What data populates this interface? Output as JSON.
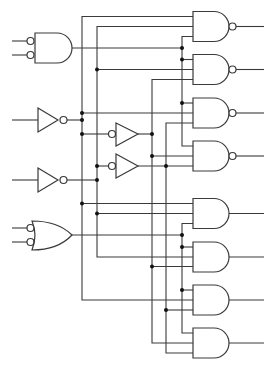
{
  "diagram": {
    "title": "",
    "type": "logic-circuit-decoder",
    "colors": {
      "line": "#3a3a3a",
      "junction": "#111111",
      "background": "#ffffff"
    },
    "left_gates": [
      {
        "id": "input-and",
        "kind": "AND",
        "inverted_inputs": true,
        "inputs_y": [
          41,
          55
        ],
        "output_y": 48
      },
      {
        "id": "inverter-1",
        "kind": "NOT",
        "input_y": 120,
        "output_y": 120
      },
      {
        "id": "inverter-2",
        "kind": "NOT",
        "input_y": 180,
        "output_y": 180
      },
      {
        "id": "input-or",
        "kind": "OR",
        "inverted_inputs": true,
        "inputs_y": [
          228,
          242
        ],
        "output_y": 235
      }
    ],
    "middle_gates": [
      {
        "id": "bubble-buffer-1",
        "kind": "NOT (input bubble)",
        "y": 134
      },
      {
        "id": "bubble-buffer-2",
        "kind": "NOT (input bubble)",
        "y": 166
      }
    ],
    "output_gates": [
      {
        "id": "gate-1",
        "kind": "NAND",
        "center_y": 26.5
      },
      {
        "id": "gate-2",
        "kind": "NAND",
        "center_y": 69.5
      },
      {
        "id": "gate-3",
        "kind": "NAND",
        "center_y": 113
      },
      {
        "id": "gate-4",
        "kind": "NAND",
        "center_y": 156
      },
      {
        "id": "gate-5",
        "kind": "AND",
        "center_y": 213.5
      },
      {
        "id": "gate-6",
        "kind": "AND",
        "center_y": 257
      },
      {
        "id": "gate-7",
        "kind": "AND",
        "center_y": 300
      },
      {
        "id": "gate-8",
        "kind": "AND",
        "center_y": 343
      }
    ],
    "bus_lines_x": [
      82,
      97,
      152,
      166,
      182
    ]
  }
}
